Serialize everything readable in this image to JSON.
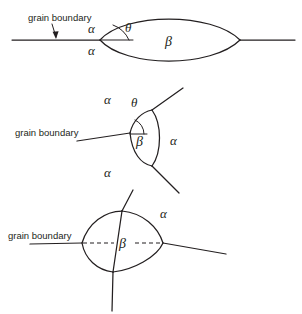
{
  "figure": {
    "background_color": "#ffffff",
    "line_color": "#231f20",
    "panels": [
      {
        "id": "panel-1",
        "name": "lens-precipitate-on-planar-grain-boundary",
        "description": "Lens-shaped beta precipitate on a straight grain boundary between two alpha grains",
        "annotation_label": "grain boundary",
        "angle_label": "θ",
        "phase_labels": [
          "α",
          "α",
          "β"
        ],
        "alpha_upper": "α",
        "alpha_lower": "α",
        "beta": "β"
      },
      {
        "id": "panel-2",
        "name": "triangular-precipitate-at-triple-junction",
        "description": "Beta precipitate at a three-grain triple junction with three alpha grains",
        "annotation_label": "grain boundary",
        "angle_label": "θ",
        "phase_labels": [
          "α",
          "α",
          "α",
          "β"
        ],
        "alpha_top": "α",
        "alpha_right": "α",
        "alpha_bottom": "α",
        "beta": "β"
      },
      {
        "id": "panel-3",
        "name": "quadrilateral-precipitate-at-quadruple-junction",
        "description": "Beta precipitate at a four-grain junction with dashed grain boundary passing through",
        "annotation_label": "grain boundary",
        "phase_labels": [
          "α",
          "β"
        ],
        "alpha_right": "α",
        "beta": "β"
      }
    ]
  }
}
